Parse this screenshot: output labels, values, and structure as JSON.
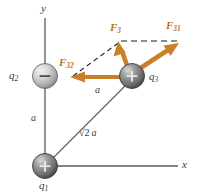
{
  "figure": {
    "colors": {
      "force_vector": "#c8802a",
      "axis_line": "#5a5a5a",
      "dashed_black": "#2b2b2b",
      "dashed_gray": "#8c8c8c",
      "label_text": "#3a3a3a",
      "force_label_text": "#b5771f",
      "sphere_light": "#c9c9c9",
      "sphere_dark": "#6e6e6e",
      "background": "#ffffff"
    }
  },
  "axes": {
    "x_label": "x",
    "y_label": "y"
  },
  "charges": [
    {
      "id": "q1",
      "label": "q",
      "subscript": "1",
      "sign": "+",
      "shade": "dark",
      "position": {
        "x": 45,
        "y": 166
      }
    },
    {
      "id": "q2",
      "label": "q",
      "subscript": "2",
      "sign": "−",
      "shade": "light",
      "position": {
        "x": 45,
        "y": 76
      }
    },
    {
      "id": "q3",
      "label": "q",
      "subscript": "3",
      "sign": "+",
      "shade": "dark",
      "position": {
        "x": 132,
        "y": 76
      }
    }
  ],
  "distance_labels": [
    {
      "id": "vertical-a",
      "text": "a"
    },
    {
      "id": "horizontal-a",
      "text": "a"
    },
    {
      "id": "diagonal",
      "radical": "√",
      "under_radical": "2",
      "text": "a"
    }
  ],
  "force_vectors": [
    {
      "id": "F32",
      "label": "F",
      "subscript": "32",
      "direction": "left"
    },
    {
      "id": "F3",
      "label": "F",
      "subscript": "3",
      "direction": "up-left"
    },
    {
      "id": "F31",
      "label": "F",
      "subscript": "31",
      "direction": "up-right"
    }
  ]
}
